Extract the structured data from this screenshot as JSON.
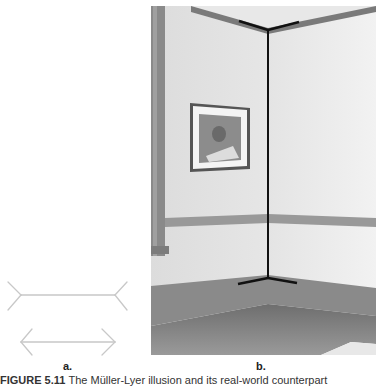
{
  "figure": {
    "panel_a": {
      "label": "a.",
      "description": "Müller-Lyer illusion",
      "line_color": "#c8c8c8",
      "top_figure": {
        "shaft": [
          21,
          25,
          115,
          25
        ],
        "fins": "outward",
        "fin_ends": [
          [
            8,
            12
          ],
          [
            8,
            40
          ],
          [
            127,
            12
          ],
          [
            127,
            40
          ]
        ]
      },
      "bottom_figure": {
        "shaft": [
          21,
          72,
          115,
          72
        ],
        "fins": "inward",
        "fin_ends": [
          [
            32,
            59
          ],
          [
            32,
            85
          ],
          [
            102,
            59
          ],
          [
            102,
            85
          ]
        ]
      }
    },
    "panel_b": {
      "label": "b.",
      "description": "Photograph of room corner with vertical corner line highlighted"
    },
    "caption": {
      "prefix": "FIGURE 5.11",
      "text": "The Müller-Lyer illusion and its real-world counterpart"
    }
  }
}
